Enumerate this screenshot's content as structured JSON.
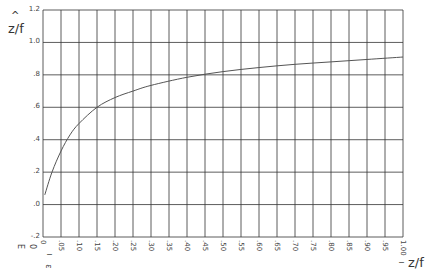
{
  "chart_data": {
    "type": "line",
    "title": "",
    "xlabel": "z/f",
    "ylabel": "ẑ/f",
    "xlim": [
      0,
      1.0
    ],
    "ylim": [
      -0.2,
      1.2
    ],
    "grid": true,
    "legend": null,
    "x_ticks": [
      "0",
      ".05",
      ".10",
      ".15",
      ".20",
      ".25",
      ".30",
      ".35",
      ".40",
      ".45",
      ".50",
      ".55",
      ".60",
      ".65",
      ".70",
      ".75",
      ".80",
      ".85",
      ".90",
      ".95",
      "1.00"
    ],
    "y_ticks": [
      "-.2",
      ".0",
      ".2",
      ".4",
      ".6",
      ".8",
      "1.0",
      "1.2"
    ],
    "series": [
      {
        "name": "ẑ/f vs z/f",
        "x": [
          0.005,
          0.025,
          0.05,
          0.075,
          0.1,
          0.15,
          0.2,
          0.25,
          0.3,
          0.4,
          0.5,
          0.6,
          0.7,
          0.8,
          0.9,
          1.0
        ],
        "y": [
          0.06,
          0.2,
          0.33,
          0.43,
          0.5,
          0.6,
          0.66,
          0.7,
          0.735,
          0.785,
          0.82,
          0.845,
          0.865,
          0.88,
          0.895,
          0.91
        ]
      }
    ],
    "annotations": [
      "E",
      "0",
      "ε"
    ]
  },
  "labels": {
    "y_title_hat": "^",
    "y_title": "z/f",
    "x_title": "z/f",
    "stray_e": "E",
    "stray_zero": "0",
    "stray_eps": "ε",
    "stray_tick": "ı"
  },
  "style": {
    "grid_color": "#333333",
    "curve_color": "#555555",
    "background": "#ffffff"
  }
}
